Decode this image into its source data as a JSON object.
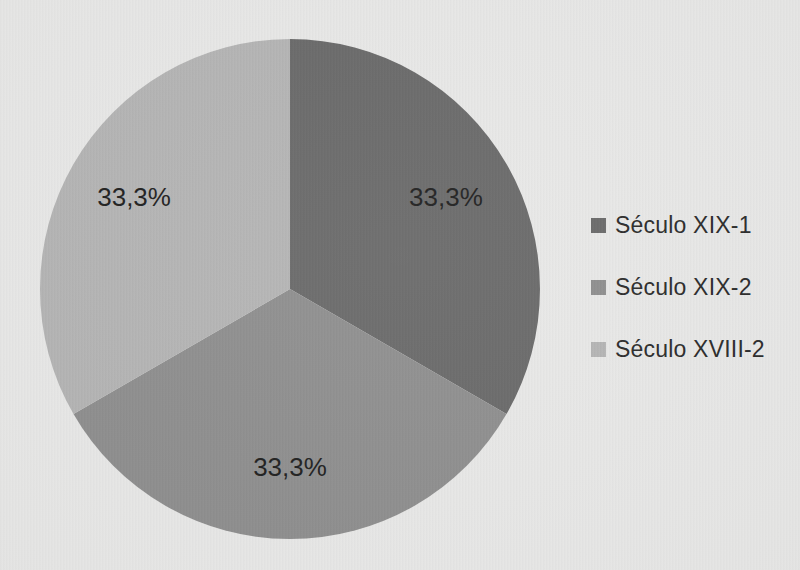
{
  "page": {
    "background_color": "#e9e9e8"
  },
  "chart_data": {
    "type": "pie",
    "title": "",
    "categories": [
      "Século XIX-1",
      "Século XIX-2",
      "Século XVIII-2"
    ],
    "values": [
      33.3,
      33.3,
      33.3
    ],
    "slice_labels": [
      "33,3%",
      "33,3%",
      "33,3%"
    ],
    "colors": [
      "#6a6a6a",
      "#8f8f8f",
      "#b5b5b5"
    ],
    "slice_label_color": "#1f1f1f",
    "legend_position": "right",
    "legend_text_color": "#2b2b2b",
    "start_angle_deg": 0,
    "direction": "clockwise",
    "grid": "off"
  },
  "pie_geometry": {
    "center_x": 290,
    "center_y": 289,
    "radius": 250,
    "label_radius_fraction": 0.72
  }
}
